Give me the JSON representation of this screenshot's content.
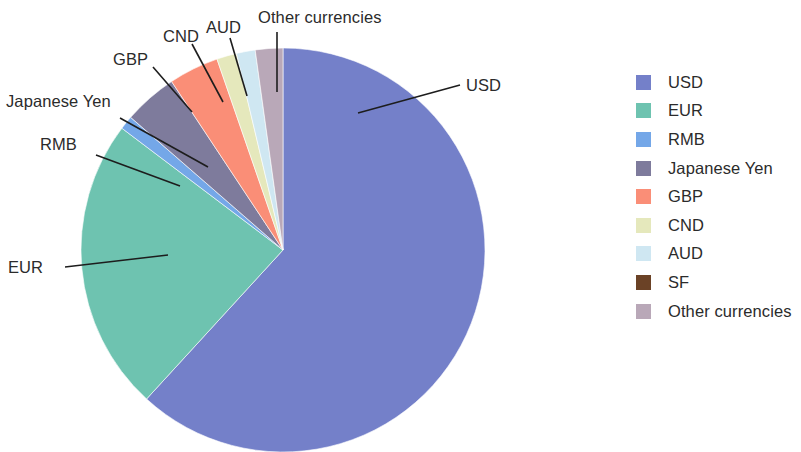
{
  "chart_data": {
    "type": "pie",
    "title": "",
    "subtitle": "",
    "xlabel": "",
    "ylabel": "",
    "legend_position": "right",
    "grid": false,
    "start_angle_deg": 0,
    "direction": "clockwise",
    "categories": [
      "USD",
      "EUR",
      "RMB",
      "Japanese Yen",
      "GBP",
      "CND",
      "AUD",
      "SF",
      "Other currencies"
    ],
    "values": [
      61.8,
      23.5,
      1.1,
      4.3,
      4.0,
      1.6,
      1.5,
      0.0,
      2.2
    ],
    "colors": [
      "#7480c9",
      "#6ec3b0",
      "#74a7e8",
      "#7e7b9c",
      "#fa8e77",
      "#e5e8bc",
      "#cfe7f2",
      "#6b4226",
      "#b9a8b8"
    ],
    "slices": [
      {
        "label": "USD",
        "value": 61.8,
        "color": "#7480c9"
      },
      {
        "label": "EUR",
        "value": 23.5,
        "color": "#6ec3b0"
      },
      {
        "label": "RMB",
        "value": 1.1,
        "color": "#74a7e8"
      },
      {
        "label": "Japanese Yen",
        "value": 4.3,
        "color": "#7e7b9c"
      },
      {
        "label": "GBP",
        "value": 4.0,
        "color": "#fa8e77"
      },
      {
        "label": "CND",
        "value": 1.6,
        "color": "#e5e8bc"
      },
      {
        "label": "AUD",
        "value": 1.5,
        "color": "#cfe7f2"
      },
      {
        "label": "SF",
        "value": 0.0,
        "color": "#6b4226"
      },
      {
        "label": "Other currencies",
        "value": 2.2,
        "color": "#b9a8b8"
      }
    ]
  },
  "callouts": {
    "usd": "USD",
    "eur": "EUR",
    "rmb": "RMB",
    "jpy": "Japanese Yen",
    "gbp": "GBP",
    "cnd": "CND",
    "aud": "AUD",
    "other": "Other currencies"
  },
  "legend": {
    "items": [
      {
        "label": "USD",
        "color": "#7480c9"
      },
      {
        "label": "EUR",
        "color": "#6ec3b0"
      },
      {
        "label": "RMB",
        "color": "#74a7e8"
      },
      {
        "label": "Japanese Yen",
        "color": "#7e7b9c"
      },
      {
        "label": "GBP",
        "color": "#fa8e77"
      },
      {
        "label": "CND",
        "color": "#e5e8bc"
      },
      {
        "label": "AUD",
        "color": "#cfe7f2"
      },
      {
        "label": "SF",
        "color": "#6b4226"
      },
      {
        "label": "Other currencies",
        "color": "#b9a8b8"
      }
    ]
  }
}
